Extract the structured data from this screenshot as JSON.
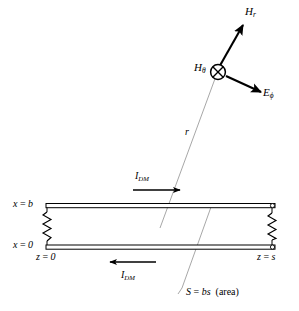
{
  "figure": {
    "kind": "technical-line-diagram",
    "background_color": "#ffffff",
    "line_color": "#000000",
    "ray_color": "#9a9a9a"
  },
  "field_vectors": {
    "origin_marker": "circle-with-cross",
    "h_r": {
      "symbol": "H",
      "subscript": "r",
      "description": "radial magnetic field vector, arrow up-right"
    },
    "h_theta": {
      "symbol": "H",
      "subscript": "θ",
      "description": "theta magnetic field, into page at observation point"
    },
    "e_phi": {
      "symbol": "E",
      "subscript": "ϕ",
      "description": "phi electric field vector, arrow down-right"
    }
  },
  "ray": {
    "symbol": "r",
    "description": "distance from loop to observation point"
  },
  "currents": {
    "top": {
      "symbol": "I",
      "subscript": "DM",
      "direction": "right"
    },
    "bottom": {
      "symbol": "I",
      "subscript": "DM",
      "direction": "left"
    }
  },
  "axis_labels": {
    "x_top": {
      "var": "x",
      "eq": " = ",
      "value": "b"
    },
    "x_bottom": {
      "var": "x",
      "eq": " = ",
      "value": "0"
    },
    "z_left": {
      "var": "z",
      "eq": " = ",
      "value": "0"
    },
    "z_right": {
      "var": "z",
      "eq": " = ",
      "value": "s"
    }
  },
  "area_note": {
    "symbol": "S",
    "eq": " = ",
    "expression": "bs",
    "suffix": "(area)"
  },
  "components": {
    "left_resistor": "resistor-zigzag",
    "right_resistor": "resistor-zigzag",
    "terminals": "open-circle-terminal"
  }
}
